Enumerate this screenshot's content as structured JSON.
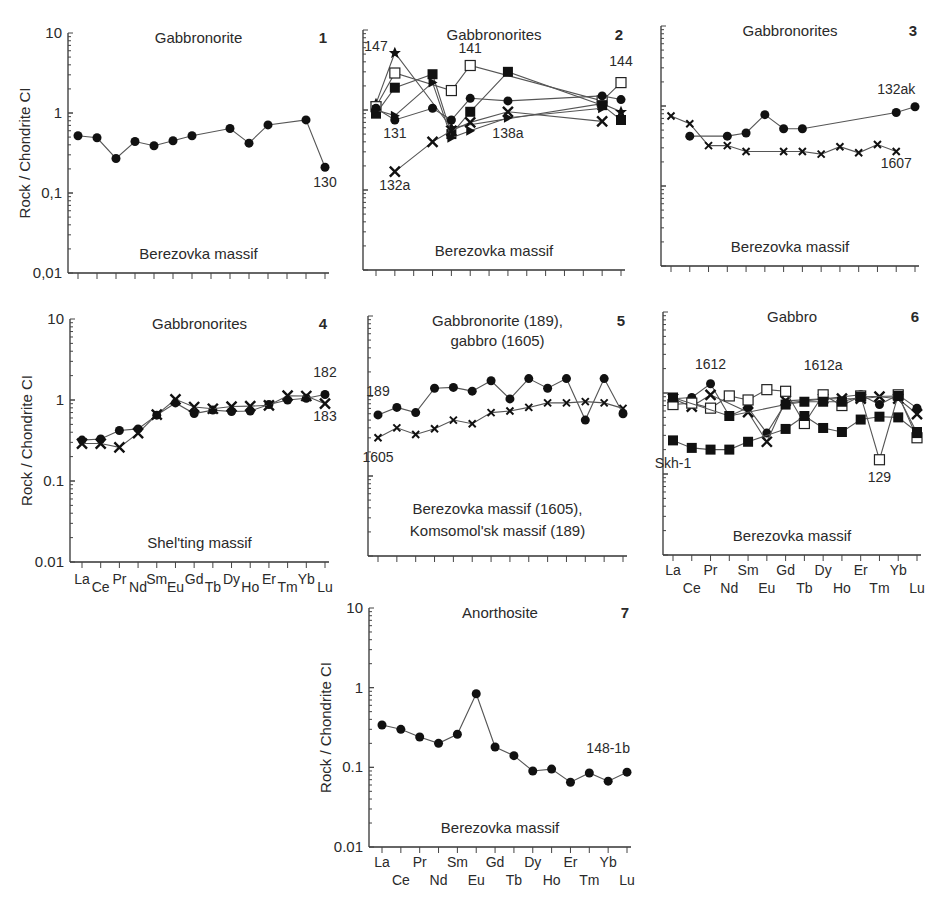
{
  "elements": [
    "La",
    "Ce",
    "Pr",
    "Nd",
    "Sm",
    "Eu",
    "Gd",
    "Tb",
    "Dy",
    "Ho",
    "Er",
    "Tm",
    "Yb",
    "Lu"
  ],
  "y_axis_label": "Rock / Chondrite CI",
  "chart_data": [
    {
      "panel": "1",
      "type": "line",
      "title": "Gabbronorite",
      "massif": "Berezovka massif",
      "yscale": "log",
      "ylim": [
        0.01,
        10
      ],
      "ytick_labels": [
        "10",
        "1",
        "0,1",
        "0,01"
      ],
      "show_ylabels": true,
      "show_xlabels": false,
      "series": [
        {
          "name": "130",
          "marker": "circle",
          "values": [
            0.52,
            0.49,
            0.27,
            0.44,
            0.39,
            0.45,
            0.52,
            null,
            0.64,
            0.42,
            0.71,
            null,
            0.82,
            0.21
          ]
        }
      ],
      "labels": [
        {
          "text": "130",
          "el": 13,
          "y": 0.12
        }
      ]
    },
    {
      "panel": "2",
      "type": "line",
      "title": "Gabbronorites",
      "massif": "Berezovka massif",
      "yscale": "log",
      "ylim": [
        0.01,
        10
      ],
      "show_ylabels": false,
      "show_xlabels": false,
      "series": [
        {
          "name": "147",
          "marker": "star",
          "values": [
            1.2,
            5.2,
            null,
            null,
            0.6,
            null,
            null,
            null,
            null,
            null,
            null,
            null,
            1.2,
            0.95
          ]
        },
        {
          "name": "141",
          "marker": "square-open",
          "values": [
            1.1,
            2.9,
            null,
            null,
            1.75,
            3.6,
            null,
            null,
            null,
            null,
            null,
            null,
            1.3,
            2.2
          ]
        },
        {
          "name": "sq-filled",
          "marker": "square",
          "values": [
            0.9,
            1.9,
            null,
            2.8,
            0.5,
            0.95,
            null,
            3.0,
            null,
            null,
            null,
            null,
            1.15,
            0.75
          ]
        },
        {
          "name": "131",
          "marker": "circle",
          "values": [
            1.05,
            0.75,
            null,
            1.05,
            0.75,
            1.4,
            null,
            1.3,
            null,
            null,
            null,
            null,
            1.5,
            1.35
          ]
        },
        {
          "name": "138a",
          "marker": "triangle",
          "values": [
            1.0,
            0.85,
            null,
            2.2,
            0.45,
            0.55,
            null,
            0.8,
            null,
            null,
            null,
            null,
            1.05,
            null
          ]
        },
        {
          "name": "132a",
          "marker": "cross",
          "values": [
            null,
            0.17,
            null,
            0.4,
            0.55,
            0.7,
            null,
            0.95,
            null,
            null,
            null,
            null,
            0.72,
            null
          ]
        }
      ],
      "labels": [
        {
          "text": "147",
          "el": 0,
          "y": 5.5
        },
        {
          "text": "141",
          "el": 5,
          "y": 5.2
        },
        {
          "text": "144",
          "el": 13,
          "y": 3.5
        },
        {
          "text": "131",
          "el": 1,
          "y": 0.45
        },
        {
          "text": "138a",
          "el": 7,
          "y": 0.45
        },
        {
          "text": "132a",
          "el": 1,
          "y": 0.1
        }
      ]
    },
    {
      "panel": "3",
      "type": "line",
      "title": "Gabbronorites",
      "massif": "Berezovka massif",
      "yscale": "log",
      "ylim": [
        0.01,
        10
      ],
      "show_ylabels": false,
      "show_xlabels": false,
      "series": [
        {
          "name": "132ak",
          "marker": "circle",
          "values": [
            null,
            0.42,
            null,
            0.42,
            0.46,
            0.78,
            0.52,
            0.52,
            null,
            null,
            null,
            null,
            0.83,
            0.98
          ]
        },
        {
          "name": "1607",
          "marker": "cross-small",
          "values": [
            0.75,
            0.6,
            0.32,
            0.32,
            0.27,
            null,
            0.27,
            0.27,
            0.25,
            0.31,
            0.26,
            0.33,
            0.27,
            null
          ]
        }
      ],
      "labels": [
        {
          "text": "132ak",
          "el": 12,
          "y": 1.4
        },
        {
          "text": "1607",
          "el": 12,
          "y": 0.17
        }
      ]
    },
    {
      "panel": "4",
      "type": "line",
      "title": "Gabbronorites",
      "massif": "Shel'ting massif",
      "yscale": "log",
      "ylim": [
        0.01,
        10
      ],
      "ytick_labels": [
        "10",
        "1",
        "0.1",
        "0.01"
      ],
      "show_ylabels": true,
      "show_xlabels": true,
      "xlabel_style": "staggered",
      "series": [
        {
          "name": "182",
          "marker": "circle",
          "values": [
            0.32,
            0.33,
            0.42,
            0.44,
            0.65,
            0.92,
            0.68,
            0.75,
            0.72,
            0.73,
            0.88,
            1.0,
            1.05,
            1.17
          ]
        },
        {
          "name": "183",
          "marker": "cross",
          "values": [
            0.29,
            0.29,
            0.26,
            0.39,
            0.66,
            1.02,
            0.82,
            0.78,
            0.83,
            0.84,
            0.86,
            1.13,
            1.12,
            0.9
          ]
        }
      ],
      "labels": [
        {
          "text": "182",
          "el": 13,
          "y": 1.9
        },
        {
          "text": "183",
          "el": 13,
          "y": 0.55
        }
      ]
    },
    {
      "panel": "5",
      "type": "line",
      "title": "Gabbronorite (189),",
      "title2": "gabbro (1605)",
      "massif": "Berezovka massif (1605),",
      "massif2": "Komsomol'sk massif (189)",
      "yscale": "log",
      "ylim": [
        0.01,
        10
      ],
      "show_ylabels": false,
      "show_xlabels": false,
      "series": [
        {
          "name": "189",
          "marker": "circle",
          "values": [
            0.58,
            0.72,
            0.62,
            1.25,
            1.28,
            1.15,
            1.55,
            0.92,
            1.65,
            1.25,
            1.65,
            0.5,
            1.65,
            0.6
          ]
        },
        {
          "name": "1605",
          "marker": "cross-small",
          "values": [
            0.3,
            0.4,
            0.33,
            0.39,
            0.5,
            0.45,
            0.62,
            0.65,
            0.72,
            0.82,
            0.82,
            0.85,
            0.82,
            0.7
          ]
        }
      ],
      "labels": [
        {
          "text": "189",
          "el": 0,
          "y": 1.0
        },
        {
          "text": "1605",
          "el": 0,
          "y": 0.15
        }
      ]
    },
    {
      "panel": "6",
      "type": "line",
      "title": "Gabbro",
      "massif": "Berezovka massif",
      "yscale": "log",
      "ylim": [
        0.01,
        10
      ],
      "show_ylabels": false,
      "show_xlabels": true,
      "xlabel_style": "two-row",
      "series": [
        {
          "name": "1612",
          "marker": "circle",
          "values": [
            0.85,
            0.88,
            1.3,
            0.52,
            0.66,
            0.32,
            0.75,
            null,
            null,
            null,
            0.95,
            0.72,
            0.95,
            0.65
          ]
        },
        {
          "name": "1612a",
          "marker": "cross",
          "values": [
            0.85,
            0.68,
            0.95,
            null,
            0.58,
            0.25,
            0.8,
            null,
            0.85,
            0.85,
            0.85,
            0.9,
            0.85,
            0.55
          ]
        },
        {
          "name": "129",
          "marker": "square-open",
          "values": [
            0.72,
            0.75,
            0.65,
            0.92,
            0.82,
            1.1,
            1.05,
            0.42,
            0.95,
            0.7,
            0.92,
            0.15,
            0.95,
            0.28
          ]
        },
        {
          "name": "sq-upper",
          "marker": "square",
          "values": [
            0.88,
            null,
            null,
            0.52,
            null,
            null,
            0.72,
            0.78,
            0.78,
            0.78,
            0.9,
            null,
            0.92,
            0.32
          ]
        },
        {
          "name": "Skh-1",
          "marker": "square",
          "values": [
            0.26,
            0.21,
            0.2,
            0.2,
            0.25,
            null,
            0.36,
            0.52,
            0.37,
            0.33,
            0.47,
            0.51,
            0.5,
            0.33
          ]
        }
      ],
      "labels": [
        {
          "text": "1612",
          "el": 2,
          "y": 2.0
        },
        {
          "text": "1612a",
          "el": 8,
          "y": 1.9
        },
        {
          "text": "129",
          "el": 11,
          "y": 0.08
        },
        {
          "text": "Skh-1",
          "el": 0,
          "y": 0.12
        }
      ]
    },
    {
      "panel": "7",
      "type": "line",
      "title": "Anorthosite",
      "massif": "Berezovka massif",
      "yscale": "log",
      "ylim": [
        0.01,
        10
      ],
      "ytick_labels": [
        "10",
        "1",
        "0.1",
        "0.01"
      ],
      "show_ylabels": true,
      "show_xlabels": true,
      "xlabel_style": "two-row",
      "series": [
        {
          "name": "148-1b",
          "marker": "circle",
          "values": [
            0.34,
            0.3,
            0.24,
            0.2,
            0.26,
            0.84,
            0.18,
            0.14,
            0.09,
            0.095,
            0.065,
            0.085,
            0.067,
            0.087
          ]
        }
      ],
      "labels": [
        {
          "text": "148-1b",
          "el": 12,
          "y": 0.15
        }
      ]
    }
  ]
}
